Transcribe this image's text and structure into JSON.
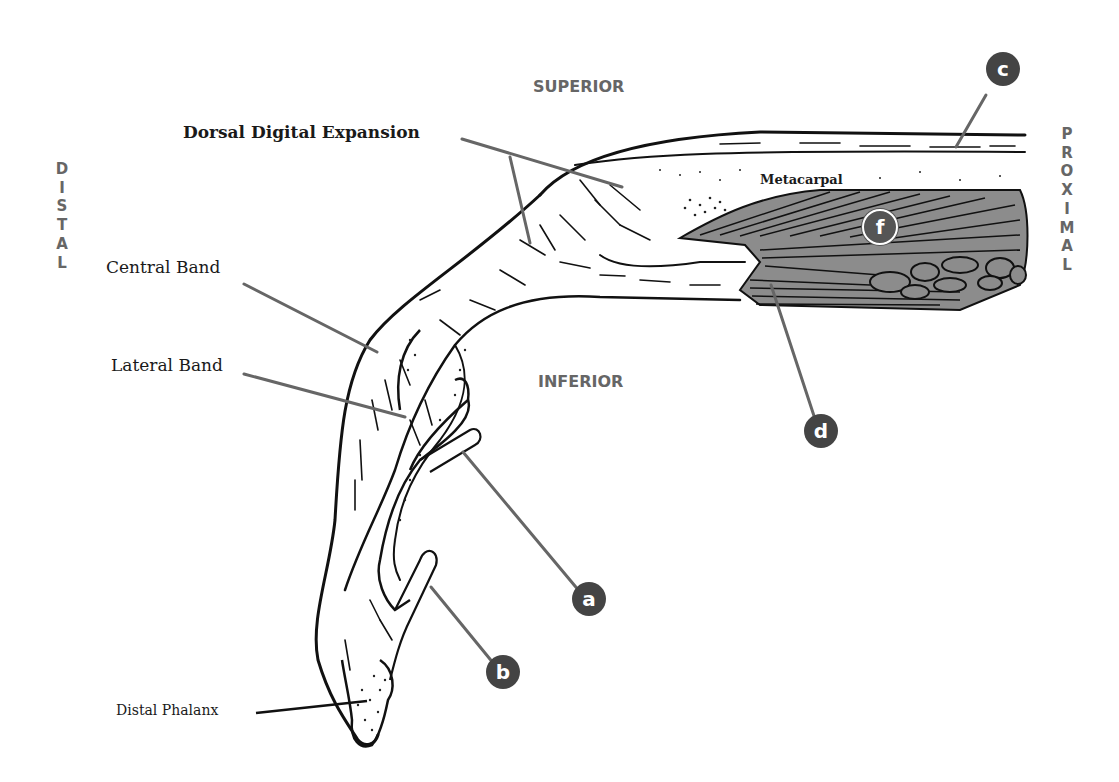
{
  "labels": {
    "dorsal_digital_expansion": "Dorsal Digital Expansion",
    "central_band": "Central Band",
    "lateral_band": "Lateral Band",
    "distal_phalanx": "Distal Phalanx",
    "metacarpal": "Metacarpal"
  },
  "directions": {
    "superior": "SUPERIOR",
    "inferior": "INFERIOR",
    "distal": [
      "D",
      "I",
      "S",
      "T",
      "A",
      "L"
    ],
    "proximal": [
      "P",
      "R",
      "O",
      "X",
      "I",
      "M",
      "A",
      "L"
    ]
  },
  "markers": {
    "a": "a",
    "b": "b",
    "c": "c",
    "d": "d",
    "f": "f"
  },
  "colors": {
    "marker_fill": "#444444",
    "leader_line": "#666666",
    "direction_text": "#666666",
    "muscle_gray": "#8c8c8c",
    "outline": "#111111"
  }
}
